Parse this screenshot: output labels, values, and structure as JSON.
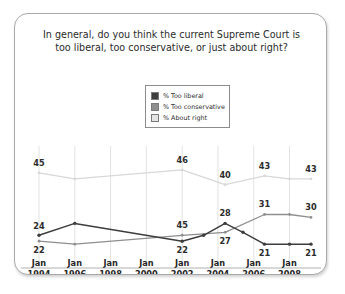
{
  "card": {
    "title_line1": "In general, do you think the current Supreme Court is",
    "title_line2": "too liberal, too conservative, or just about right?"
  },
  "legend": {
    "items": [
      {
        "label": "% Too liberal",
        "color": "#3d3d3d"
      },
      {
        "label": "% Too conservative",
        "color": "#8e8e8e"
      },
      {
        "label": "% About right",
        "color": "#d8d8d8"
      }
    ]
  },
  "chart_data": {
    "type": "line",
    "title": "In general, do you think the current Supreme Court is too liberal, too conservative, or just about right?",
    "xlabel": "",
    "ylabel": "",
    "ylim": [
      15,
      50
    ],
    "grid": true,
    "legend_position": "top-center",
    "categories": [
      "Jan 1994",
      "Jan 1996",
      "Jan 1998",
      "Jan 2000",
      "Jan 2002",
      "Jan 2004",
      "Jan 2006",
      "Jan 2008"
    ],
    "x_tick_labels": [
      {
        "month": "Jan",
        "year": "1994"
      },
      {
        "month": "Jan",
        "year": "1996"
      },
      {
        "month": "Jan",
        "year": "1998"
      },
      {
        "month": "Jan",
        "year": "2000"
      },
      {
        "month": "Jan",
        "year": "2002"
      },
      {
        "month": "Jan",
        "year": "2004"
      },
      {
        "month": "Jan",
        "year": "2006"
      },
      {
        "month": "Jan",
        "year": "2008"
      }
    ],
    "series": [
      {
        "name": "% Too liberal",
        "color": "#3d3d3d",
        "points": [
          {
            "x": 1994.0,
            "y": 24,
            "label": "24",
            "label_pos": "left"
          },
          {
            "x": 1996.0,
            "y": 28,
            "label": "",
            "label_pos": ""
          },
          {
            "x": 2002.0,
            "y": 22,
            "label": "22",
            "label_pos": "below"
          },
          {
            "x": 2003.2,
            "y": 24,
            "label": "",
            "label_pos": ""
          },
          {
            "x": 2004.4,
            "y": 28,
            "label": "28",
            "label_pos": "above"
          },
          {
            "x": 2005.4,
            "y": 25,
            "label": "",
            "label_pos": ""
          },
          {
            "x": 2006.6,
            "y": 21,
            "label": "21",
            "label_pos": "below"
          },
          {
            "x": 2008.0,
            "y": 21,
            "label": "",
            "label_pos": ""
          },
          {
            "x": 2009.2,
            "y": 21,
            "label": "21",
            "label_pos": "below"
          }
        ]
      },
      {
        "name": "% Too conservative",
        "color": "#8e8e8e",
        "points": [
          {
            "x": 1994.0,
            "y": 22,
            "label": "22",
            "label_pos": "below"
          },
          {
            "x": 1996.0,
            "y": 21,
            "label": "",
            "label_pos": ""
          },
          {
            "x": 2002.0,
            "y": 24,
            "label": "45",
            "label_pos": "above"
          },
          {
            "x": 2004.4,
            "y": 25,
            "label": "27",
            "label_pos": "below"
          },
          {
            "x": 2006.6,
            "y": 31,
            "label": "31",
            "label_pos": "above"
          },
          {
            "x": 2008.0,
            "y": 31,
            "label": "",
            "label_pos": ""
          },
          {
            "x": 2009.2,
            "y": 30,
            "label": "30",
            "label_pos": "above"
          }
        ]
      },
      {
        "name": "% About right",
        "color": "#d8d8d8",
        "points": [
          {
            "x": 1994.0,
            "y": 45,
            "label": "45",
            "label_pos": "above"
          },
          {
            "x": 1996.0,
            "y": 43,
            "label": "",
            "label_pos": ""
          },
          {
            "x": 2002.0,
            "y": 46,
            "label": "46",
            "label_pos": "above"
          },
          {
            "x": 2004.4,
            "y": 41,
            "label": "40",
            "label_pos": "above"
          },
          {
            "x": 2006.6,
            "y": 44,
            "label": "43",
            "label_pos": "above"
          },
          {
            "x": 2008.0,
            "y": 43,
            "label": "",
            "label_pos": ""
          },
          {
            "x": 2009.2,
            "y": 43,
            "label": "43",
            "label_pos": "above"
          }
        ]
      }
    ]
  }
}
